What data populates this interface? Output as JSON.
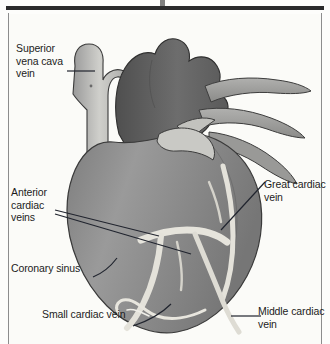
{
  "figure": {
    "kind": "anatomical-illustration",
    "palette": {
      "page_background": "#fbfbf8",
      "frame_rule": "#2b2b2b",
      "frame_side_border": "#8d8d8d",
      "label_text": "#1c1c1c",
      "leader_line": "#20242e",
      "myocardium_mid_gray": "#8e8e8e",
      "myocardium_dark_gray": "#6f6f6f",
      "great_vessel_dark": "#5d5d5d",
      "vessel_light_gray": "#b4b4b4",
      "vessel_pale": "#d9d9d6",
      "coronary_vein_pale": "#e6e4dc",
      "outline": "#3a3a3a"
    }
  },
  "labels": {
    "superior_vena_cava": "Superior\nvena cava\nvein",
    "anterior_cardiac_veins": "Anterior\ncardiac\nveins",
    "coronary_sinus": "Coronary sinus",
    "small_cardiac_vein": "Small cardiac vein",
    "great_cardiac_vein": "Great cardiac\nvein",
    "middle_cardiac_vein": "Middle cardiac\nvein"
  }
}
